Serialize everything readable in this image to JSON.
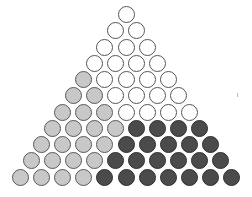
{
  "figure": {
    "rows": 11,
    "total_circles": 66,
    "colors": {
      "white": "#ffffff",
      "light": "#c8c8c8",
      "dark": "#4b4b4b",
      "outline": "#555555"
    },
    "row_layout": [
      {
        "row": 1,
        "light": 0,
        "white": 1,
        "dark": 0
      },
      {
        "row": 2,
        "light": 0,
        "white": 2,
        "dark": 0
      },
      {
        "row": 3,
        "light": 0,
        "white": 3,
        "dark": 0
      },
      {
        "row": 4,
        "light": 0,
        "white": 4,
        "dark": 0
      },
      {
        "row": 5,
        "light": 1,
        "white": 4,
        "dark": 0
      },
      {
        "row": 6,
        "light": 2,
        "white": 4,
        "dark": 0
      },
      {
        "row": 7,
        "light": 3,
        "white": 4,
        "dark": 0
      },
      {
        "row": 8,
        "light": 4,
        "white": 0,
        "dark": 4
      },
      {
        "row": 9,
        "light": 4,
        "white": 0,
        "dark": 5
      },
      {
        "row": 10,
        "light": 4,
        "white": 0,
        "dark": 6
      },
      {
        "row": 11,
        "light": 4,
        "white": 0,
        "dark": 7
      }
    ],
    "region_counts": {
      "white": 22,
      "light": 26,
      "dark": 22
    }
  }
}
